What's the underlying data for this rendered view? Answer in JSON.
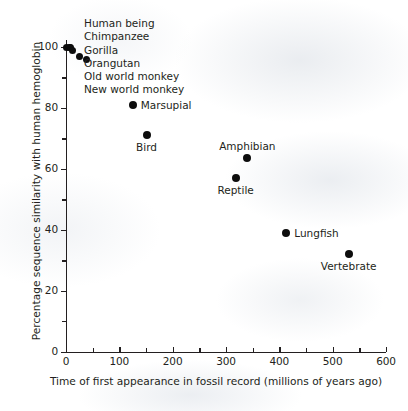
{
  "chart_data": {
    "type": "scatter",
    "title": "",
    "xlabel": "Time of first appearance in fossil record (millions of years ago)",
    "ylabel": "Percentage sequence similarity with human hemoglobin",
    "xlim": [
      0,
      600
    ],
    "ylim": [
      0,
      100
    ],
    "xticks": [
      0,
      100,
      200,
      300,
      400,
      500,
      600
    ],
    "yticks": [
      0,
      20,
      40,
      60,
      80,
      100
    ],
    "xtick_labels": [
      "0",
      "100",
      "200",
      "300",
      "400",
      "500",
      "600"
    ],
    "ytick_labels": [
      "0",
      "20",
      "40",
      "60",
      "80",
      "100"
    ],
    "x_minor_tick_step": 50,
    "y_minor_tick_step": 10,
    "grid": false,
    "legend": false,
    "marker_color": "#0d0d0d",
    "axis_color": "#231f20",
    "points": [
      {
        "label": "Human being",
        "x": 0,
        "y": 100,
        "label_mode": "stacked"
      },
      {
        "label": "Chimpanzee",
        "x": 6,
        "y": 100,
        "label_mode": "stacked"
      },
      {
        "label": "Gorilla",
        "x": 8,
        "y": 100,
        "label_mode": "stacked"
      },
      {
        "label": "Orangutan",
        "x": 13,
        "y": 99,
        "label_mode": "stacked"
      },
      {
        "label": "Old world monkey",
        "x": 25,
        "y": 97,
        "label_mode": "stacked"
      },
      {
        "label": "New world monkey",
        "x": 38,
        "y": 96,
        "label_mode": "stacked"
      },
      {
        "label": "Marsupial",
        "x": 125,
        "y": 81,
        "label_mode": "right"
      },
      {
        "label": "Bird",
        "x": 151,
        "y": 71,
        "label_mode": "below"
      },
      {
        "label": "Amphibian",
        "x": 340,
        "y": 63.5,
        "label_mode": "above"
      },
      {
        "label": "Reptile",
        "x": 318,
        "y": 57,
        "label_mode": "below"
      },
      {
        "label": "Lungfish",
        "x": 413,
        "y": 39,
        "label_mode": "right"
      },
      {
        "label": "Vertebrate",
        "x": 530,
        "y": 32,
        "label_mode": "below"
      }
    ],
    "stacked_label_list": [
      "Human being",
      "Chimpanzee",
      "Gorilla",
      "Orangutan",
      "Old world monkey",
      "New world monkey"
    ]
  }
}
